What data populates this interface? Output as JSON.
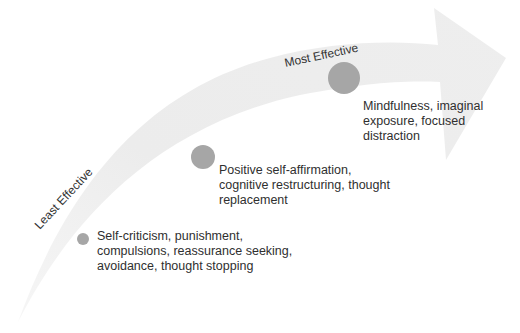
{
  "diagram": {
    "type": "curved-progress-arrow",
    "colors": {
      "arrow_fill": "#efefef",
      "dot_fill": "#a6a6a6",
      "text": "#2f2f2f"
    },
    "axis": {
      "start_label": "Least Effective",
      "end_label": "Most Effective"
    },
    "stages": [
      {
        "level": "low",
        "lines": [
          "Self-criticism, punishment,",
          "compulsions, reassurance seeking,",
          "avoidance, thought stopping"
        ]
      },
      {
        "level": "medium",
        "lines": [
          "Positive self-affirmation,",
          "cognitive restructuring, thought",
          "replacement"
        ]
      },
      {
        "level": "high",
        "lines": [
          "Mindfulness, imaginal",
          "exposure, focused",
          "distraction"
        ]
      }
    ]
  }
}
